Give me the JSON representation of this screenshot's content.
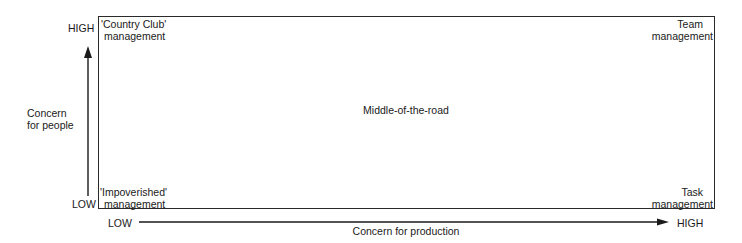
{
  "diagram": {
    "type": "managerial-grid",
    "y_axis": {
      "label_line1": "Concern",
      "label_line2": "for people",
      "high": "HIGH",
      "low": "LOW"
    },
    "x_axis": {
      "label": "Concern for production",
      "low": "LOW",
      "high": "HIGH"
    },
    "quadrants": {
      "top_left": {
        "line1": "'Country Club'",
        "line2": "management"
      },
      "top_right": {
        "line1": "Team",
        "line2": "management"
      },
      "center": {
        "line1": "Middle-of-the-road"
      },
      "bottom_left": {
        "line1": "'Impoverished'",
        "line2": "management"
      },
      "bottom_right": {
        "line1": "Task",
        "line2": "management"
      }
    },
    "colors": {
      "ink": "#1a1a1a",
      "background": "#ffffff"
    }
  }
}
